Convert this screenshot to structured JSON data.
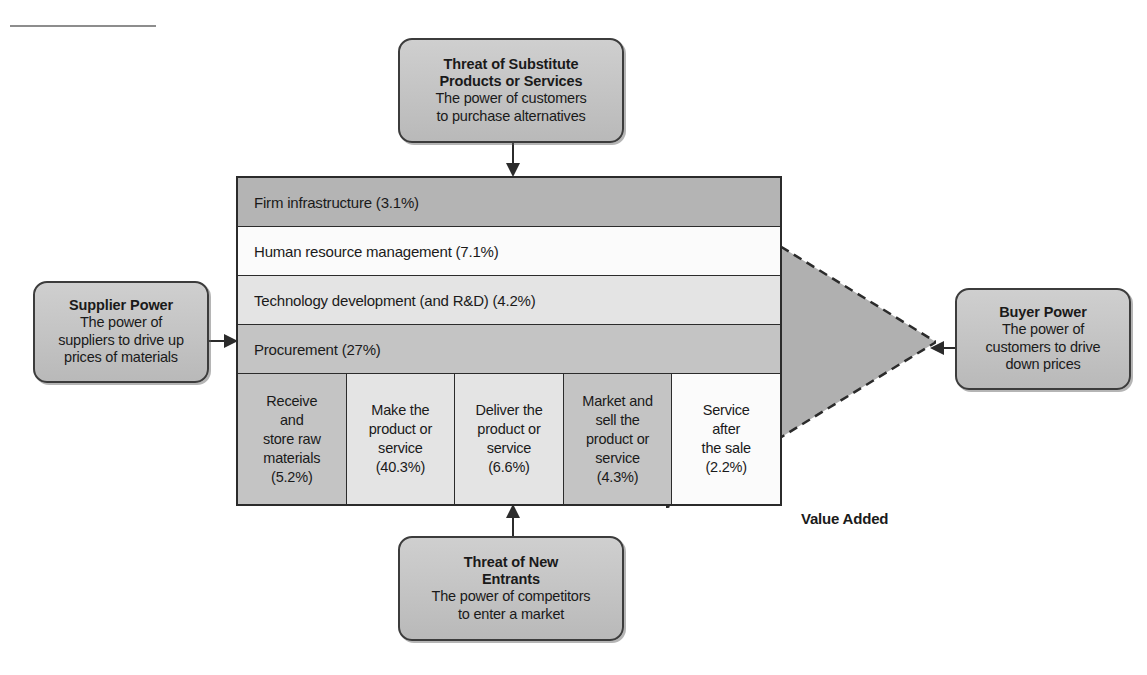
{
  "scan": {
    "top_artifact_text": " "
  },
  "diagram": {
    "value_added_label": "Value Added",
    "colors": {
      "box_fill": "#c2c2c2",
      "box_border": "#3c3c3c",
      "chain_border": "#2b2b2b",
      "wedge_fill": "#b0b0b0",
      "row_dark": "#b4b4b4",
      "row_mid": "#c4c4c4",
      "row_light": "#e4e4e4",
      "row_white": "#fbfbfb"
    }
  },
  "forces": {
    "substitute": {
      "title_line1": "Threat of Substitute",
      "title_line2": "Products or Services",
      "desc_line1": "The power of customers",
      "desc_line2": "to purchase alternatives"
    },
    "supplier": {
      "title_line1": "Supplier Power",
      "desc_line1": "The power of",
      "desc_line2": "suppliers to drive up",
      "desc_line3": "prices of materials"
    },
    "buyer": {
      "title_line1": "Buyer Power",
      "desc_line1": "The power of",
      "desc_line2": "customers to drive",
      "desc_line3": "down prices"
    },
    "entrants": {
      "title_line1": "Threat of New",
      "title_line2": "Entrants",
      "desc_line1": "The power of competitors",
      "desc_line2": "to enter a market"
    }
  },
  "chart_data": {
    "type": "table",
    "support_activities": [
      {
        "label": "Firm infrastructure (3.1%)",
        "name": "Firm infrastructure",
        "value": 3.1,
        "tone": "dark"
      },
      {
        "label": "Human resource management (7.1%)",
        "name": "Human resource management",
        "value": 7.1,
        "tone": "white"
      },
      {
        "label": "Technology development (and R&D) (4.2%)",
        "name": "Technology development (and R&D)",
        "value": 4.2,
        "tone": "light"
      },
      {
        "label": "Procurement (27%)",
        "name": "Procurement",
        "value": 27.0,
        "tone": "mid"
      }
    ],
    "primary_activities": [
      {
        "lines": [
          "Receive",
          "and",
          "store raw",
          "materials",
          "(5.2%)"
        ],
        "name": "Inbound logistics",
        "value": 5.2,
        "tone": "mid"
      },
      {
        "lines": [
          "Make the",
          "product or",
          "service",
          "(40.3%)"
        ],
        "name": "Operations",
        "value": 40.3,
        "tone": "light"
      },
      {
        "lines": [
          "Deliver the",
          "product or",
          "service",
          "(6.6%)"
        ],
        "name": "Outbound logistics",
        "value": 6.6,
        "tone": "light"
      },
      {
        "lines": [
          "Market and",
          "sell the",
          "product or",
          "service",
          "(4.3%)"
        ],
        "name": "Marketing and sales",
        "value": 4.3,
        "tone": "mid"
      },
      {
        "lines": [
          "Service",
          "after",
          "the sale",
          "(2.2%)"
        ],
        "name": "Service",
        "value": 2.2,
        "tone": "white"
      }
    ]
  }
}
